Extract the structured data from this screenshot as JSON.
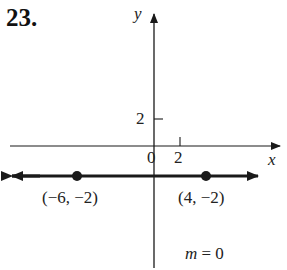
{
  "problem_number": "23.",
  "axes": {
    "x_label": "x",
    "y_label": "y",
    "origin_label": "0",
    "x_tick_label": "2",
    "y_tick_label": "2"
  },
  "points": [
    {
      "label": "(−6, −2)",
      "x": -6,
      "y": -2
    },
    {
      "label": "(4, −2)",
      "x": 4,
      "y": -2
    }
  ],
  "slope": {
    "var": "m",
    "text": " = 0"
  },
  "colors": {
    "ink": "#1a1a1a"
  }
}
